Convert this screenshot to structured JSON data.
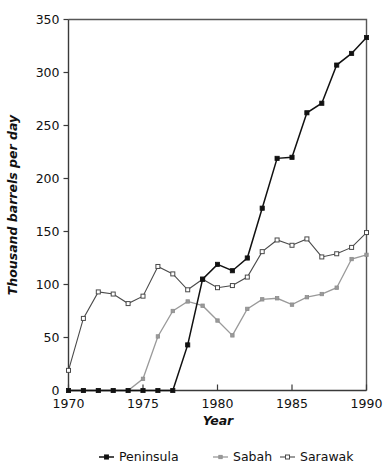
{
  "chart_data": {
    "type": "line",
    "title": "",
    "xlabel": "Year",
    "ylabel": "Thousand barrels per day",
    "xlim": [
      1970,
      1990
    ],
    "ylim": [
      0,
      350
    ],
    "xticks": [
      1970,
      1975,
      1980,
      1985,
      1990
    ],
    "yticks": [
      0,
      50,
      100,
      150,
      200,
      250,
      300,
      350
    ],
    "xtick_labels": [
      "1970",
      "1975",
      "1980",
      "1985",
      "1990"
    ],
    "ytick_labels": [
      "0",
      "50",
      "100",
      "150",
      "200",
      "250",
      "300",
      "350"
    ],
    "grid": false,
    "legend_position": "bottom",
    "x": [
      1970,
      1971,
      1972,
      1973,
      1974,
      1975,
      1976,
      1977,
      1978,
      1979,
      1980,
      1981,
      1982,
      1983,
      1984,
      1985,
      1986,
      1987,
      1988,
      1989,
      1990
    ],
    "series": [
      {
        "name": "Peninsula",
        "marker": "filled-square",
        "color": "#111111",
        "values": [
          0,
          0,
          0,
          0,
          0,
          0,
          0,
          0,
          43,
          105,
          119,
          113,
          125,
          172,
          219,
          220,
          262,
          271,
          307,
          318,
          333
        ]
      },
      {
        "name": "Sabah",
        "marker": "filled-square-gray",
        "color": "#9a9a9a",
        "values": [
          0,
          0,
          0,
          0,
          0,
          11,
          51,
          75,
          84,
          80,
          66,
          52,
          77,
          86,
          87,
          81,
          88,
          91,
          97,
          124,
          128
        ]
      },
      {
        "name": "Sarawak",
        "marker": "open-square",
        "color": "#4a4a4a",
        "values": [
          19,
          68,
          93,
          91,
          82,
          89,
          117,
          110,
          95,
          105,
          97,
          99,
          107,
          131,
          142,
          137,
          143,
          126,
          129,
          135,
          149
        ]
      }
    ]
  },
  "legend": {
    "items": [
      {
        "label": "Peninsula"
      },
      {
        "label": "Sabah"
      },
      {
        "label": "Sarawak"
      }
    ]
  }
}
